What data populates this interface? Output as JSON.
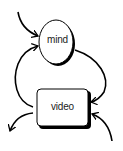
{
  "diagram": {
    "nodes": [
      {
        "id": "mind",
        "label": "mind",
        "shape": "ellipse"
      },
      {
        "id": "video",
        "label": "video",
        "shape": "rounded-rect"
      }
    ],
    "edges": [
      {
        "from": "external-top-left",
        "to": "mind"
      },
      {
        "from": "mind",
        "to": "video"
      },
      {
        "from": "video",
        "to": "mind"
      },
      {
        "from": "video",
        "to": "external-bottom-left"
      },
      {
        "from": "external-bottom-right",
        "to": "video"
      }
    ],
    "colors": {
      "stroke": "#000000",
      "shadow": "#000000",
      "fill": "#ffffff",
      "text": "#222222"
    }
  }
}
